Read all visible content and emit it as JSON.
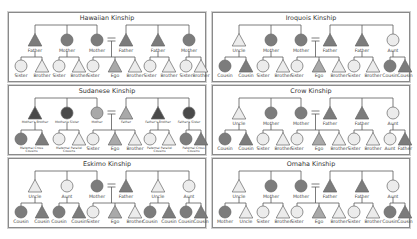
{
  "colors": {
    "line": "#5a5a5a",
    "stroke": "#666666",
    "white": "#ececec",
    "light": "#cfcfcf",
    "mid": "#a9a9a9",
    "dark": "#7c7c7c",
    "darkest": "#4a4a4a",
    "label": "#444444",
    "border": "#8a8a8a"
  },
  "panels": [
    {
      "id": "hawaiian",
      "title": "Hawaiian Kinship",
      "x": 8,
      "y": 12,
      "parents": [
        {
          "shape": "tri",
          "fill": "dark",
          "label": "Father"
        },
        {
          "shape": "circ",
          "fill": "dark",
          "label": "Mother"
        },
        {
          "shape": "circ",
          "fill": "dark",
          "label": "Mother"
        },
        {
          "shape": "tri",
          "fill": "dark",
          "label": "Father"
        },
        {
          "shape": "tri",
          "fill": "dark",
          "label": "Father"
        },
        {
          "shape": "circ",
          "fill": "dark",
          "label": "Mother"
        }
      ],
      "children": [
        {
          "shape": "circ",
          "fill": "white",
          "label": "Sister"
        },
        {
          "shape": "tri",
          "fill": "white",
          "label": "Brother"
        },
        {
          "shape": "circ",
          "fill": "white",
          "label": "Sister"
        },
        {
          "shape": "tri",
          "fill": "white",
          "label": "Brother"
        },
        {
          "shape": "circ",
          "fill": "white",
          "label": "Sister"
        },
        {
          "shape": "tri",
          "fill": "mid",
          "label": "Ego"
        },
        {
          "shape": "tri",
          "fill": "white",
          "label": "Brother"
        },
        {
          "shape": "circ",
          "fill": "white",
          "label": "Sister"
        },
        {
          "shape": "tri",
          "fill": "white",
          "label": "Brother"
        },
        {
          "shape": "circ",
          "fill": "white",
          "label": "Sister"
        },
        {
          "shape": "tri",
          "fill": "white",
          "label": "Brother"
        }
      ]
    },
    {
      "id": "iroquois",
      "title": "Iroquois Kinship",
      "x": 212,
      "y": 12,
      "parents": [
        {
          "shape": "tri",
          "fill": "white",
          "label": "Uncle"
        },
        {
          "shape": "circ",
          "fill": "dark",
          "label": "Mother"
        },
        {
          "shape": "circ",
          "fill": "dark",
          "label": "Mother"
        },
        {
          "shape": "tri",
          "fill": "dark",
          "label": "Father"
        },
        {
          "shape": "tri",
          "fill": "dark",
          "label": "Father"
        },
        {
          "shape": "circ",
          "fill": "white",
          "label": "Aunt"
        }
      ],
      "children": [
        {
          "shape": "circ",
          "fill": "dark",
          "label": "Cousin"
        },
        {
          "shape": "tri",
          "fill": "dark",
          "label": "Cousin"
        },
        {
          "shape": "circ",
          "fill": "white",
          "label": "Sister"
        },
        {
          "shape": "tri",
          "fill": "white",
          "label": "Brother"
        },
        {
          "shape": "circ",
          "fill": "white",
          "label": "Sister"
        },
        {
          "shape": "tri",
          "fill": "mid",
          "label": "Ego"
        },
        {
          "shape": "tri",
          "fill": "white",
          "label": "Brother"
        },
        {
          "shape": "circ",
          "fill": "white",
          "label": "Sister"
        },
        {
          "shape": "tri",
          "fill": "white",
          "label": "Brother"
        },
        {
          "shape": "circ",
          "fill": "dark",
          "label": "Cousin"
        },
        {
          "shape": "tri",
          "fill": "dark",
          "label": "Cousin"
        }
      ]
    },
    {
      "id": "sudanese",
      "title": "Sudanese Kinship",
      "x": 8,
      "y": 85,
      "small_labels": true,
      "parents": [
        {
          "shape": "tri",
          "fill": "darkest",
          "label": "Mother's Brother"
        },
        {
          "shape": "circ",
          "fill": "darkest",
          "label": "Mother's Sister"
        },
        {
          "shape": "circ",
          "fill": "mid",
          "label": "Mother"
        },
        {
          "shape": "tri",
          "fill": "mid",
          "label": "Father"
        },
        {
          "shape": "tri",
          "fill": "darkest",
          "label": "Father's Brother"
        },
        {
          "shape": "circ",
          "fill": "darkest",
          "label": "Father's Sister"
        }
      ],
      "children_groups": [
        {
          "label": "Maternal Cross Cousins"
        },
        {
          "label": "Maternal Parallel Cousins"
        },
        null,
        {
          "label": "Paternal Parallel Cousins"
        },
        {
          "label": "Paternal Cross Cousins"
        }
      ],
      "children": [
        {
          "shape": "circ",
          "fill": "dark",
          "label": ""
        },
        {
          "shape": "tri",
          "fill": "dark",
          "label": ""
        },
        {
          "shape": "circ",
          "fill": "white",
          "label": ""
        },
        {
          "shape": "tri",
          "fill": "white",
          "label": ""
        },
        {
          "shape": "circ",
          "fill": "white",
          "label": "Sister"
        },
        {
          "shape": "tri",
          "fill": "mid",
          "label": "Ego"
        },
        {
          "shape": "tri",
          "fill": "white",
          "label": "Brother"
        },
        {
          "shape": "circ",
          "fill": "white",
          "label": ""
        },
        {
          "shape": "tri",
          "fill": "white",
          "label": ""
        },
        {
          "shape": "circ",
          "fill": "dark",
          "label": ""
        },
        {
          "shape": "tri",
          "fill": "dark",
          "label": ""
        }
      ]
    },
    {
      "id": "crow",
      "title": "Crow Kinship",
      "x": 212,
      "y": 85,
      "parents": [
        {
          "shape": "tri",
          "fill": "white",
          "label": "Uncle"
        },
        {
          "shape": "circ",
          "fill": "dark",
          "label": "Mother"
        },
        {
          "shape": "circ",
          "fill": "dark",
          "label": "Mother"
        },
        {
          "shape": "tri",
          "fill": "dark",
          "label": "Father"
        },
        {
          "shape": "tri",
          "fill": "dark",
          "label": "Father"
        },
        {
          "shape": "circ",
          "fill": "white",
          "label": "Aunt"
        }
      ],
      "children": [
        {
          "shape": "circ",
          "fill": "dark",
          "label": "Cousin"
        },
        {
          "shape": "tri",
          "fill": "dark",
          "label": "Cousin"
        },
        {
          "shape": "circ",
          "fill": "white",
          "label": "Sister"
        },
        {
          "shape": "tri",
          "fill": "white",
          "label": "Brother"
        },
        {
          "shape": "circ",
          "fill": "white",
          "label": "Sister"
        },
        {
          "shape": "tri",
          "fill": "mid",
          "label": "Ego"
        },
        {
          "shape": "tri",
          "fill": "white",
          "label": "Brother"
        },
        {
          "shape": "circ",
          "fill": "white",
          "label": "Sister"
        },
        {
          "shape": "tri",
          "fill": "white",
          "label": "Brother"
        },
        {
          "shape": "circ",
          "fill": "white",
          "label": "Aunt"
        },
        {
          "shape": "tri",
          "fill": "dark",
          "label": "Father"
        }
      ]
    },
    {
      "id": "eskimo",
      "title": "Eskimo Kinship",
      "x": 8,
      "y": 158,
      "parents": [
        {
          "shape": "tri",
          "fill": "white",
          "label": "Uncle"
        },
        {
          "shape": "circ",
          "fill": "white",
          "label": "Aunt"
        },
        {
          "shape": "circ",
          "fill": "dark",
          "label": "Mother"
        },
        {
          "shape": "tri",
          "fill": "dark",
          "label": "Father"
        },
        {
          "shape": "tri",
          "fill": "white",
          "label": "Uncle"
        },
        {
          "shape": "circ",
          "fill": "white",
          "label": "Aunt"
        }
      ],
      "children": [
        {
          "shape": "circ",
          "fill": "dark",
          "label": "Cousin"
        },
        {
          "shape": "tri",
          "fill": "dark",
          "label": "Cousin"
        },
        {
          "shape": "circ",
          "fill": "dark",
          "label": "Cousin"
        },
        {
          "shape": "tri",
          "fill": "dark",
          "label": "Cousin"
        },
        {
          "shape": "circ",
          "fill": "white",
          "label": "Sister"
        },
        {
          "shape": "tri",
          "fill": "mid",
          "label": "Ego"
        },
        {
          "shape": "tri",
          "fill": "white",
          "label": "Brother"
        },
        {
          "shape": "circ",
          "fill": "dark",
          "label": "Cousin"
        },
        {
          "shape": "tri",
          "fill": "dark",
          "label": "Cousin"
        },
        {
          "shape": "circ",
          "fill": "dark",
          "label": "Cousin"
        },
        {
          "shape": "tri",
          "fill": "dark",
          "label": "Cousin"
        }
      ]
    },
    {
      "id": "omaha",
      "title": "Omaha Kinship",
      "x": 212,
      "y": 158,
      "parents": [
        {
          "shape": "tri",
          "fill": "white",
          "label": "Uncle"
        },
        {
          "shape": "circ",
          "fill": "dark",
          "label": "Mother"
        },
        {
          "shape": "circ",
          "fill": "dark",
          "label": "Mother"
        },
        {
          "shape": "tri",
          "fill": "dark",
          "label": "Father"
        },
        {
          "shape": "tri",
          "fill": "dark",
          "label": "Father"
        },
        {
          "shape": "circ",
          "fill": "white",
          "label": "Aunt"
        }
      ],
      "children": [
        {
          "shape": "circ",
          "fill": "dark",
          "label": "Mother"
        },
        {
          "shape": "tri",
          "fill": "white",
          "label": "Uncle"
        },
        {
          "shape": "circ",
          "fill": "white",
          "label": "Sister"
        },
        {
          "shape": "tri",
          "fill": "white",
          "label": "Brother"
        },
        {
          "shape": "circ",
          "fill": "white",
          "label": "Sister"
        },
        {
          "shape": "tri",
          "fill": "mid",
          "label": "Ego"
        },
        {
          "shape": "tri",
          "fill": "white",
          "label": "Brother"
        },
        {
          "shape": "circ",
          "fill": "white",
          "label": "Sister"
        },
        {
          "shape": "tri",
          "fill": "white",
          "label": "Brother"
        },
        {
          "shape": "circ",
          "fill": "dark",
          "label": "Cousin"
        },
        {
          "shape": "tri",
          "fill": "dark",
          "label": "Cousin"
        }
      ]
    }
  ]
}
